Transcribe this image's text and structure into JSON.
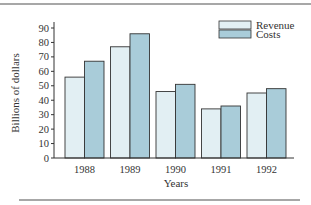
{
  "chart_data": {
    "type": "bar",
    "title": "",
    "xlabel": "Years",
    "ylabel": "Billions of dollars",
    "categories": [
      "1988",
      "1989",
      "1990",
      "1991",
      "1992"
    ],
    "series": [
      {
        "name": "Revenue",
        "values": [
          56,
          77,
          46,
          34,
          45
        ],
        "color": "#e2eff3"
      },
      {
        "name": "Costs",
        "values": [
          67,
          86,
          51,
          36,
          48
        ],
        "color": "#a9ccd9"
      }
    ],
    "ylim": [
      0,
      90
    ],
    "yticks": [
      0,
      10,
      20,
      30,
      40,
      50,
      60,
      70,
      80,
      90
    ],
    "grid": false,
    "legend_position": "top-right"
  },
  "colors": {
    "bar_outline": "#333333",
    "axis": "#333333",
    "rule": "#8a8a8a"
  }
}
